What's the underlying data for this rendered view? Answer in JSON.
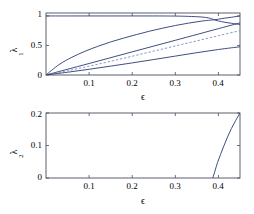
{
  "figure": {
    "background": "#ffffff",
    "line_color": "#2b3a72",
    "dashed_color": "#7b8fc4",
    "axis_color": "#4d4d5e"
  },
  "chart_data": [
    {
      "type": "line",
      "panel": "top",
      "title": "",
      "xlabel": "ϵ",
      "ylabel": "λ",
      "ylabel_sub": "1",
      "xlim": [
        0.0,
        0.45
      ],
      "ylim": [
        0.0,
        1.05
      ],
      "xticks": [
        0.1,
        0.2,
        0.3,
        0.4
      ],
      "xticklabels": [
        "0.1",
        "0.2",
        "0.3",
        "0.4"
      ],
      "yticks": [
        0,
        0.5,
        1
      ],
      "yticklabels": [
        "0",
        "0.5",
        "1"
      ],
      "grid": false,
      "legend": "none",
      "series": [
        {
          "name": "upper-flat-branch",
          "style": "solid",
          "x": [
            0.0,
            0.05,
            0.1,
            0.15,
            0.2,
            0.25,
            0.3,
            0.33,
            0.355,
            0.37,
            0.382,
            0.39
          ],
          "y": [
            1.0,
            1.0,
            1.0,
            1.0,
            1.0,
            1.0,
            0.998,
            0.993,
            0.985,
            0.975,
            0.958,
            0.935
          ]
        },
        {
          "name": "upper-rising-branch",
          "style": "solid",
          "x": [
            0.39,
            0.4,
            0.415,
            0.43,
            0.45
          ],
          "y": [
            0.935,
            0.945,
            0.963,
            0.978,
            1.0
          ]
        },
        {
          "name": "lower-of-split-branch",
          "style": "solid",
          "x": [
            0.39,
            0.4,
            0.415,
            0.43,
            0.45
          ],
          "y": [
            0.935,
            0.915,
            0.893,
            0.876,
            0.855
          ]
        },
        {
          "name": "main-curved-branch",
          "style": "solid",
          "x": [
            0.0,
            0.03,
            0.06,
            0.09,
            0.12,
            0.15,
            0.18,
            0.21,
            0.24,
            0.27,
            0.3,
            0.33,
            0.36,
            0.39
          ],
          "y": [
            0.0,
            0.175,
            0.3,
            0.4,
            0.485,
            0.56,
            0.625,
            0.685,
            0.742,
            0.792,
            0.838,
            0.878,
            0.912,
            0.935
          ]
        },
        {
          "name": "straight-branch",
          "style": "solid",
          "x": [
            0.0,
            0.1,
            0.2,
            0.3,
            0.4,
            0.45
          ],
          "y": [
            0.0,
            0.195,
            0.392,
            0.588,
            0.785,
            0.883
          ]
        },
        {
          "name": "dashed-branch",
          "style": "dashed",
          "x": [
            0.0,
            0.05,
            0.1,
            0.15,
            0.2,
            0.25,
            0.3,
            0.35,
            0.4,
            0.45
          ],
          "y": [
            0.0,
            0.072,
            0.15,
            0.232,
            0.318,
            0.405,
            0.492,
            0.578,
            0.665,
            0.752
          ]
        },
        {
          "name": "lowest-branch",
          "style": "solid",
          "x": [
            0.0,
            0.05,
            0.1,
            0.15,
            0.2,
            0.25,
            0.3,
            0.35,
            0.4,
            0.45
          ],
          "y": [
            0.0,
            0.047,
            0.097,
            0.15,
            0.205,
            0.262,
            0.32,
            0.378,
            0.432,
            0.478
          ]
        }
      ]
    },
    {
      "type": "line",
      "panel": "bottom",
      "title": "",
      "xlabel": "ϵ",
      "ylabel": "λ",
      "ylabel_sub": "2",
      "xlim": [
        0.0,
        0.45
      ],
      "ylim": [
        0.0,
        0.2
      ],
      "xticks": [
        0.1,
        0.2,
        0.3,
        0.4
      ],
      "xticklabels": [
        "0.1",
        "0.2",
        "0.3",
        "0.4"
      ],
      "yticks": [
        0,
        0.1,
        0.2
      ],
      "yticklabels": [
        "0",
        "0.1",
        "0.2"
      ],
      "grid": false,
      "legend": "none",
      "series": [
        {
          "name": "second-exponent-branch",
          "style": "solid",
          "x": [
            0.387,
            0.392,
            0.398,
            0.405,
            0.413,
            0.421,
            0.43,
            0.44,
            0.45
          ],
          "y": [
            0.0,
            0.022,
            0.048,
            0.073,
            0.1,
            0.126,
            0.152,
            0.177,
            0.2
          ]
        }
      ]
    }
  ]
}
